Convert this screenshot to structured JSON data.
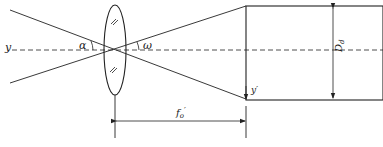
{
  "diagram": {
    "type": "optical-system-schematic",
    "labels": {
      "object_axis": "y",
      "field_angle_object": "α",
      "field_angle_image": "ω",
      "aperture": "D",
      "aperture_sub": "d",
      "image_height": "y′",
      "focal_length": "f",
      "focal_length_sub": "o",
      "focal_length_prime": "′"
    },
    "lens_marks": [
      "//",
      "//"
    ],
    "colors": {
      "line": "#222222",
      "background": "#ffffff"
    }
  }
}
